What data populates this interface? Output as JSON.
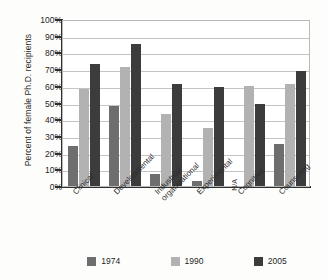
{
  "chart_data": {
    "type": "bar",
    "title": "",
    "xlabel": "",
    "ylabel": "Percent of female Ph.D. recipients",
    "ylim": [
      0,
      100
    ],
    "ytick_labels": [
      "100%",
      "90%",
      "80%",
      "70%",
      "60%",
      "50%",
      "40%",
      "30%",
      "20%",
      "10%",
      "0%"
    ],
    "ytick_values": [
      100,
      90,
      80,
      70,
      60,
      50,
      40,
      30,
      20,
      10,
      0
    ],
    "grid": true,
    "legend_position": "bottom",
    "categories": [
      "Clinical",
      "Developmental",
      "Industrial/\norganizational",
      "Experimental",
      "Cognitive",
      "Counseling"
    ],
    "category_lines": [
      [
        "Clinical"
      ],
      [
        "Developmental"
      ],
      [
        "Industrial/",
        "organizational"
      ],
      [
        "Experimental"
      ],
      [
        "Cognitive"
      ],
      [
        "Counseling"
      ]
    ],
    "series": [
      {
        "name": "1974",
        "color": "#6e6e6e",
        "values": [
          24,
          48,
          7,
          3,
          null,
          25
        ]
      },
      {
        "name": "1990",
        "color": "#b2b2b2",
        "values": [
          58,
          71,
          43,
          35,
          60,
          61
        ]
      },
      {
        "name": "2005",
        "color": "#3c3c3c",
        "values": [
          73,
          85,
          61,
          59,
          49,
          69
        ]
      }
    ],
    "annotations": [
      {
        "text": "N/A",
        "series": "1974",
        "category": "Cognitive"
      }
    ]
  },
  "legend": {
    "items": [
      {
        "label": "1974",
        "color": "#6e6e6e"
      },
      {
        "label": "1990",
        "color": "#b2b2b2"
      },
      {
        "label": "2005",
        "color": "#3c3c3c"
      }
    ]
  },
  "na_text": "N/A"
}
